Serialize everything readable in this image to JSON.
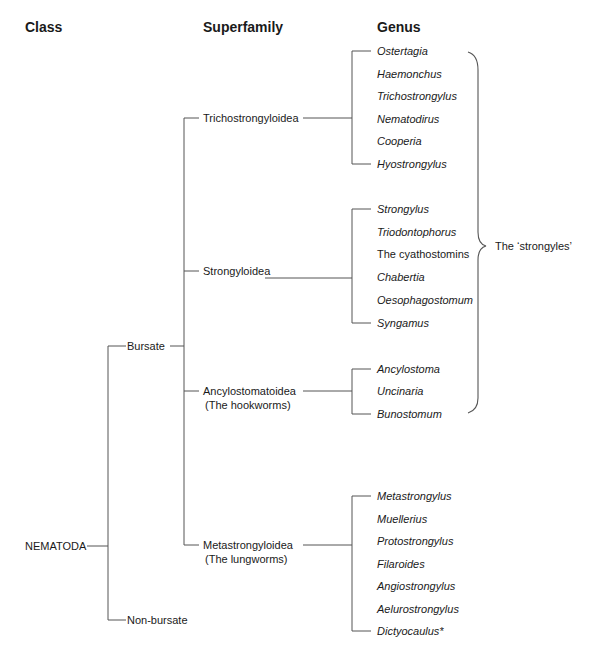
{
  "headers": {
    "class": "Class",
    "superfamily": "Superfamily",
    "genus": "Genus"
  },
  "class": {
    "root": "NEMATODA",
    "branches": [
      "Bursate",
      "Non-bursate"
    ]
  },
  "superfamilies": [
    {
      "name": "Trichostrongyloidea",
      "note": ""
    },
    {
      "name": "Strongyloidea",
      "note": ""
    },
    {
      "name": "Ancylostomatoidea",
      "note": "(The hookworms)"
    },
    {
      "name": "Metastrongyloidea",
      "note": "(The lungworms)"
    }
  ],
  "genera": {
    "trichostrongyloidea": [
      "Ostertagia",
      "Haemonchus",
      "Trichostrongylus",
      "Nematodirus",
      "Cooperia",
      "Hyostrongylus"
    ],
    "strongyloidea": [
      "Strongylus",
      "Triodontophorus",
      "The cyathostomins",
      "Chabertia",
      "Oesophagostomum",
      "Syngamus"
    ],
    "ancylostomatoidea": [
      "Ancylostoma",
      "Uncinaria",
      "Bunostomum"
    ],
    "metastrongyloidea": [
      "Metastrongylus",
      "Muellerius",
      "Protostrongylus",
      "Filaroides",
      "Angiostrongylus",
      "Aelurostrongylus",
      "Dictyocaulus*"
    ]
  },
  "brace_label": "The ‘strongyles’"
}
